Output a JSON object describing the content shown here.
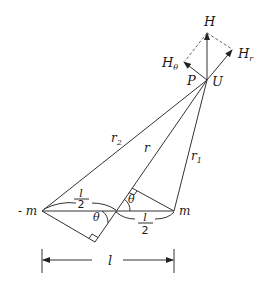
{
  "diagram": {
    "type": "dipole-field-geometry",
    "points": {
      "negative_charge": {
        "label": "- m"
      },
      "positive_charge": {
        "label": "m"
      },
      "observation_point": {
        "label_p": "P",
        "label_u": "U"
      }
    },
    "distances": {
      "r2": {
        "label": "r",
        "sub": "2"
      },
      "r": {
        "label": "r"
      },
      "r1": {
        "label": "r",
        "sub": "1"
      },
      "half_left": {
        "num": "l",
        "den": "2"
      },
      "half_right": {
        "num": "l",
        "den": "2"
      },
      "full": {
        "label": "l"
      }
    },
    "angles": {
      "theta_left": "θ",
      "theta_right": "θ"
    },
    "vectors": {
      "H": {
        "label": "H"
      },
      "H_theta": {
        "label": "H",
        "sub": "θ"
      },
      "H_r": {
        "label": "H",
        "sub": "r"
      }
    }
  }
}
